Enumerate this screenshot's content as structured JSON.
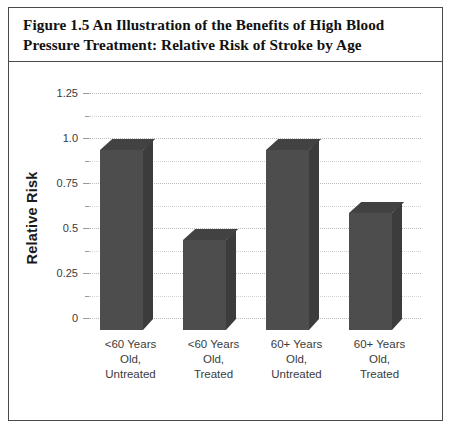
{
  "figure": {
    "caption": "Figure 1.5  An Illustration of the Benefits of High Blood Pressure Treatment: Relative Risk of Stroke by Age"
  },
  "colors": {
    "bar_front": "#4d4d4d",
    "bar_top": "#424242",
    "bar_side": "#3c3c3c",
    "frame": "#4a4a4a",
    "gridline": "#bcbcbc",
    "text": "#3b3b3b"
  },
  "chart_data": {
    "type": "bar",
    "title": "Figure 1.5  An Illustration of the Benefits of High Blood Pressure Treatment: Relative Risk of Stroke by Age",
    "xlabel": "",
    "ylabel": "Relative Risk",
    "categories": [
      "<60 Years Old, Untreated",
      "<60 Years Old, Treated",
      "60+ Years Old, Untreated",
      "60+ Years Old, Treated"
    ],
    "category_lines": [
      [
        "<60 Years",
        "Old,",
        "Untreated"
      ],
      [
        "<60 Years",
        "Old,",
        "Treated"
      ],
      [
        "60+ Years",
        "Old,",
        "Untreated"
      ],
      [
        "60+ Years",
        "Old,",
        "Treated"
      ]
    ],
    "values": [
      1.0,
      0.5,
      1.0,
      0.65
    ],
    "ylim": [
      0,
      1.25
    ],
    "yticks": [
      0,
      0.25,
      0.5,
      0.75,
      1.0,
      1.25
    ],
    "ytick_labels": [
      "0",
      "0.25",
      "0.5",
      "0.75",
      "1.0",
      "1.25"
    ],
    "yticks_minor": [
      0.125,
      0.375,
      0.625,
      0.875,
      1.125
    ],
    "grid": true,
    "legend": null,
    "style": "3d-columns"
  }
}
